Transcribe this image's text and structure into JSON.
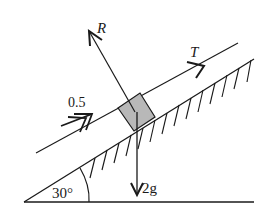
{
  "diagram": {
    "type": "inclined-plane-force-diagram",
    "angle_label": "30°",
    "forces": {
      "normal_reaction": "R",
      "tension": "T",
      "weight": "2g"
    },
    "acceleration_label": "0.5",
    "colors": {
      "line": "#1a1a1a",
      "block_fill": "#b8b8b8",
      "background": "#ffffff"
    }
  }
}
